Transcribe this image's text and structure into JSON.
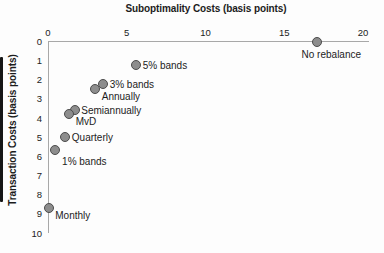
{
  "chart_data": {
    "type": "scatter",
    "title": "Suboptimality Costs (basis points)",
    "xlabel": "Suboptimality Costs (basis points)",
    "ylabel": "Transaction Costs (basis points)",
    "xlim": [
      0,
      20
    ],
    "ylim": [
      0,
      10
    ],
    "y_axis_inverted": true,
    "x_axis_position": "top",
    "x_ticks": [
      0,
      5,
      10,
      15,
      20
    ],
    "y_ticks": [
      0,
      1,
      2,
      3,
      4,
      5,
      6,
      7,
      8,
      9,
      10
    ],
    "grid": false,
    "legend": false,
    "marker": {
      "shape": "circle",
      "fill": "#8d8d8d",
      "stroke": "#4c4c4c"
    },
    "points": [
      {
        "label": "No rebalance",
        "x": 17.1,
        "y": 0.0,
        "label_side": "below-center"
      },
      {
        "label": "5% bands",
        "x": 5.6,
        "y": 1.25,
        "label_side": "right"
      },
      {
        "label": "3% bands",
        "x": 3.5,
        "y": 2.2,
        "label_side": "right"
      },
      {
        "label": "Annually",
        "x": 3.0,
        "y": 2.5,
        "label_side": "below-right"
      },
      {
        "label": "Semiannually",
        "x": 1.7,
        "y": 3.6,
        "label_side": "right"
      },
      {
        "label": "MvD",
        "x": 1.35,
        "y": 3.8,
        "label_side": "below-right"
      },
      {
        "label": "Quarterly",
        "x": 1.1,
        "y": 5.0,
        "label_side": "right"
      },
      {
        "label": "1% bands",
        "x": 0.45,
        "y": 5.65,
        "label_side": "below"
      },
      {
        "label": "Monthly",
        "x": 0.05,
        "y": 8.7,
        "label_side": "below-right"
      }
    ]
  },
  "colors": {
    "marker_fill": "#8d8d8d",
    "marker_stroke": "#4c4c4c",
    "axis": "#a8a8a8",
    "text": "#1c1c1c",
    "scan_strip": "#161616",
    "background": "#fdfdfd"
  }
}
